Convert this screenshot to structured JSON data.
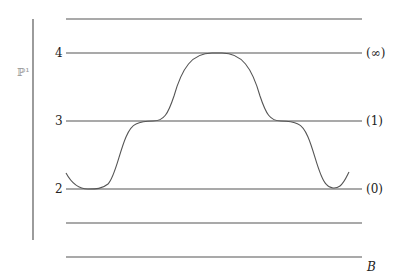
{
  "diagram": {
    "vertical_axis_label": "ℙ¹",
    "base_label": "B",
    "levels": [
      {
        "left_label": "",
        "right_label": ""
      },
      {
        "left_label": "4",
        "right_label": "(∞)"
      },
      {
        "left_label": "3",
        "right_label": "(1)"
      },
      {
        "left_label": "2",
        "right_label": "(0)"
      },
      {
        "left_label": "",
        "right_label": ""
      }
    ],
    "curve_description": "section curve starting near level 2, dipping to 2, rising through 3 to 4, plateau at 4, descending through 3 to 2, then rising slightly"
  }
}
